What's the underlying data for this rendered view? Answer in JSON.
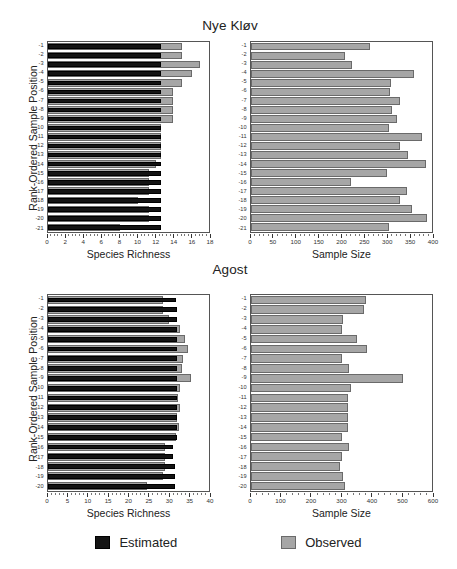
{
  "figure": {
    "legend": {
      "estimated_label": "Estimated",
      "observed_label": "Observed",
      "estimated_color": "#141414",
      "observed_color": "#a6a6a6"
    },
    "axis_titles": {
      "species_richness": "Species Richness",
      "sample_size": "Sample Size",
      "y": "Rank-Ordered Sample Position"
    }
  },
  "chart_data": [
    {
      "type": "bar",
      "orientation": "horizontal",
      "title": "Nye Kløv",
      "panel": "top-left",
      "xlabel": "Species Richness",
      "ylabel": "Rank-Ordered Sample Position",
      "xlim": [
        0,
        18
      ],
      "xticks": [
        0,
        2,
        4,
        6,
        8,
        10,
        12,
        14,
        16,
        18
      ],
      "grid": false,
      "legend_position": "bottom",
      "categories": [
        "-1",
        "-2",
        "-3",
        "-4",
        "-5",
        "-6",
        "-7",
        "-8",
        "-9",
        "-10",
        "-11",
        "-12",
        "-13",
        "-14",
        "-15",
        "-16",
        "-17",
        "-18",
        "-19",
        "-20",
        "-21"
      ],
      "series": [
        {
          "name": "Observed",
          "color": "#a6a6a6",
          "values": [
            15.0,
            15.0,
            17.0,
            16.1,
            15.0,
            14.0,
            14.0,
            14.0,
            14.0,
            12.6,
            12.6,
            12.6,
            12.6,
            12.1,
            11.3,
            11.3,
            11.3,
            10.1,
            11.3,
            11.3,
            8.1
          ]
        },
        {
          "name": "Estimated",
          "color": "#141414",
          "values": [
            12.6,
            12.6,
            12.6,
            12.6,
            12.6,
            12.6,
            12.6,
            12.6,
            12.6,
            12.6,
            12.6,
            12.6,
            12.6,
            12.6,
            12.6,
            12.6,
            12.6,
            12.6,
            12.6,
            12.6,
            12.6
          ]
        }
      ]
    },
    {
      "type": "bar",
      "orientation": "horizontal",
      "title": "Nye Kløv",
      "panel": "top-right",
      "xlabel": "Sample Size",
      "ylabel": "Rank-Ordered Sample Position",
      "xlim": [
        0,
        400
      ],
      "xticks": [
        0,
        50,
        100,
        150,
        200,
        250,
        300,
        350,
        400
      ],
      "grid": false,
      "categories": [
        "-1",
        "-2",
        "-3",
        "-4",
        "-5",
        "-6",
        "-7",
        "-8",
        "-9",
        "-10",
        "-11",
        "-12",
        "-13",
        "-14",
        "-15",
        "-16",
        "-17",
        "-18",
        "-19",
        "-20",
        "-21"
      ],
      "series": [
        {
          "name": "Observed",
          "color": "#a6a6a6",
          "values": [
            263,
            208,
            224,
            360,
            310,
            308,
            330,
            312,
            322,
            305,
            377,
            330,
            348,
            387,
            300,
            220,
            344,
            330,
            356,
            390,
            305
          ]
        }
      ]
    },
    {
      "type": "bar",
      "orientation": "horizontal",
      "title": "Agost",
      "panel": "bottom-left",
      "xlabel": "Species Richness",
      "ylabel": "Rank-Ordered Sample Position",
      "xlim": [
        0,
        40
      ],
      "xticks": [
        0,
        5,
        10,
        15,
        20,
        25,
        30,
        35,
        40
      ],
      "grid": false,
      "categories": [
        "-1",
        "-2",
        "-3",
        "-4",
        "-5",
        "-6",
        "-7",
        "-8",
        "-9",
        "-10",
        "-11",
        "-12",
        "-13",
        "-14",
        "-15",
        "-16",
        "-17",
        "-18",
        "-19",
        "-20"
      ],
      "series": [
        {
          "name": "Observed",
          "color": "#a6a6a6",
          "values": [
            28.5,
            28.5,
            30.0,
            32.8,
            34.0,
            34.8,
            33.5,
            33.4,
            35.6,
            32.8,
            32.4,
            32.9,
            32.0,
            32.5,
            31.8,
            29.0,
            29.0,
            29.0,
            28.5,
            24.5
          ]
        },
        {
          "name": "Estimated",
          "color": "#141414",
          "values": [
            31.8,
            32.0,
            32.0,
            32.0,
            32.0,
            32.0,
            32.0,
            32.0,
            32.0,
            32.0,
            32.0,
            32.0,
            32.0,
            32.0,
            32.0,
            31.0,
            31.0,
            31.5,
            31.5,
            31.5
          ]
        }
      ]
    },
    {
      "type": "bar",
      "orientation": "horizontal",
      "title": "Agost",
      "panel": "bottom-right",
      "xlabel": "Sample Size",
      "ylabel": "Rank-Ordered Sample Position",
      "xlim": [
        0,
        600
      ],
      "xticks": [
        0,
        100,
        200,
        300,
        400,
        500,
        600
      ],
      "grid": false,
      "categories": [
        "-1",
        "-2",
        "-3",
        "-4",
        "-5",
        "-6",
        "-7",
        "-8",
        "-9",
        "-10",
        "-11",
        "-12",
        "-13",
        "-14",
        "-15",
        "-16",
        "-17",
        "-18",
        "-19",
        "-20"
      ],
      "series": [
        {
          "name": "Observed",
          "color": "#a6a6a6",
          "values": [
            380,
            375,
            305,
            300,
            353,
            385,
            300,
            325,
            505,
            330,
            320,
            322,
            322,
            320,
            300,
            325,
            300,
            295,
            305,
            310
          ]
        }
      ]
    }
  ]
}
